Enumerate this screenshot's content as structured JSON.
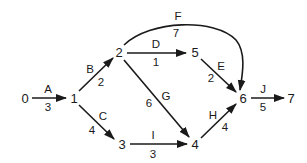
{
  "diagram": {
    "type": "activity-on-arrow network",
    "nodes": [
      {
        "id": "0",
        "label": "0",
        "x": 25,
        "y": 98
      },
      {
        "id": "1",
        "label": "1",
        "x": 74,
        "y": 98
      },
      {
        "id": "2",
        "label": "2",
        "x": 119,
        "y": 52
      },
      {
        "id": "3",
        "label": "3",
        "x": 122,
        "y": 144
      },
      {
        "id": "4",
        "label": "4",
        "x": 195,
        "y": 144
      },
      {
        "id": "5",
        "label": "5",
        "x": 195,
        "y": 52
      },
      {
        "id": "6",
        "label": "6",
        "x": 243,
        "y": 98
      },
      {
        "id": "7",
        "label": "7",
        "x": 291,
        "y": 98
      }
    ],
    "edges": [
      {
        "activity": "A",
        "duration": "3",
        "from": "0",
        "to": "1"
      },
      {
        "activity": "B",
        "duration": "2",
        "from": "1",
        "to": "2"
      },
      {
        "activity": "C",
        "duration": "4",
        "from": "1",
        "to": "3"
      },
      {
        "activity": "D",
        "duration": "1",
        "from": "2",
        "to": "5"
      },
      {
        "activity": "E",
        "duration": "2",
        "from": "5",
        "to": "6"
      },
      {
        "activity": "F",
        "duration": "7",
        "from": "2",
        "to": "6"
      },
      {
        "activity": "G",
        "duration": "6",
        "from": "2",
        "to": "4"
      },
      {
        "activity": "H",
        "duration": "4",
        "from": "4",
        "to": "6"
      },
      {
        "activity": "I",
        "duration": "3",
        "from": "3",
        "to": "4"
      },
      {
        "activity": "J",
        "duration": "5",
        "from": "6",
        "to": "7"
      }
    ]
  },
  "colors": {
    "stroke": "#1a1a1a",
    "background": "#ffffff"
  }
}
